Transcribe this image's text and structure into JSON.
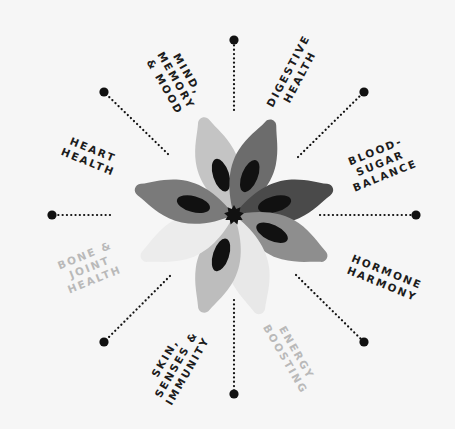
{
  "diagram": {
    "type": "radial-flower",
    "center": {
      "x": 234,
      "y": 215
    },
    "colors": {
      "background": "#f6f6f6",
      "dark_text": "#1c1c1c",
      "light_text": "#b9b9b9",
      "dot": "#111111",
      "center_star": "#111111",
      "petal_inner": "#111111"
    },
    "spokes": [
      {
        "name": "top",
        "x1": 234,
        "y1": 110,
        "x2": 234,
        "y2": 40
      },
      {
        "name": "top-right",
        "x1": 298,
        "y1": 157,
        "x2": 364,
        "y2": 92
      },
      {
        "name": "right",
        "x1": 320,
        "y1": 215,
        "x2": 416,
        "y2": 215
      },
      {
        "name": "bottom-right",
        "x1": 296,
        "y1": 275,
        "x2": 364,
        "y2": 342
      },
      {
        "name": "bottom",
        "x1": 234,
        "y1": 300,
        "x2": 234,
        "y2": 394
      },
      {
        "name": "bottom-left",
        "x1": 170,
        "y1": 276,
        "x2": 104,
        "y2": 342
      },
      {
        "name": "left",
        "x1": 110,
        "y1": 215,
        "x2": 52,
        "y2": 215
      },
      {
        "name": "top-left",
        "x1": 168,
        "y1": 154,
        "x2": 104,
        "y2": 92
      }
    ],
    "petals": [
      {
        "name": "petal-mind-memory-mood",
        "angle": -18,
        "fill": "#c4c4c4",
        "opacity": 1
      },
      {
        "name": "petal-digestive-health",
        "angle": 22,
        "fill": "#6c6c6c",
        "opacity": 1
      },
      {
        "name": "petal-blood-sugar-balance",
        "angle": 75,
        "fill": "#4a4a4a",
        "opacity": 1
      },
      {
        "name": "petal-hormone-harmony",
        "angle": 115,
        "fill": "#8e8e8e",
        "opacity": 1
      },
      {
        "name": "petal-energy-boosting",
        "angle": 165,
        "fill": "#e8e8e8",
        "opacity": 1
      },
      {
        "name": "petal-skin-senses-immunity",
        "angle": 198,
        "fill": "#bdbdbd",
        "opacity": 1
      },
      {
        "name": "petal-bone-joint-health",
        "angle": 245,
        "fill": "#ececec",
        "opacity": 1
      },
      {
        "name": "petal-heart-health",
        "angle": 285,
        "fill": "#7a7a7a",
        "opacity": 1
      }
    ],
    "labels": [
      {
        "id": "mind",
        "text": "MIND,\nMEMORY\n& MOOD",
        "tone": "dark",
        "x": 176,
        "y": 80,
        "rotate": 60
      },
      {
        "id": "digestive",
        "text": "DIGESTIVE\nHEALTH",
        "tone": "dark",
        "x": 294,
        "y": 74,
        "rotate": -62
      },
      {
        "id": "blood_sugar",
        "text": "BLOOD-\nSUGAR\nBALANCE",
        "tone": "dark",
        "x": 380,
        "y": 163,
        "rotate": -22
      },
      {
        "id": "hormone",
        "text": "HORMONE\nHARMONY",
        "tone": "dark",
        "x": 384,
        "y": 278,
        "rotate": 22
      },
      {
        "id": "energy",
        "text": "ENERGY\nBOOSTING",
        "tone": "light",
        "x": 291,
        "y": 356,
        "rotate": 60
      },
      {
        "id": "skin",
        "text": "SKIN,\nSENSES &\nIMMUNITY",
        "tone": "dark",
        "x": 176,
        "y": 364,
        "rotate": -60
      },
      {
        "id": "bone",
        "text": "BONE &\nJOINT\nHEALTH",
        "tone": "light",
        "x": 90,
        "y": 267,
        "rotate": -22
      },
      {
        "id": "heart",
        "text": "HEART\nHEALTH",
        "tone": "dark",
        "x": 90,
        "y": 156,
        "rotate": 22
      }
    ]
  }
}
